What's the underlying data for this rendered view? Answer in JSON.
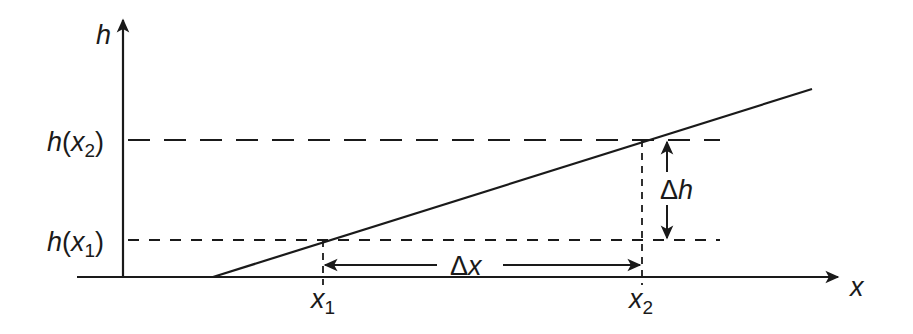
{
  "diagram": {
    "axes": {
      "y_label": "h",
      "x_label": "x"
    },
    "levels": {
      "h_x2": {
        "fn": "h",
        "arg": "x",
        "sub": "2"
      },
      "h_x1": {
        "fn": "h",
        "arg": "x",
        "sub": "1"
      }
    },
    "ticks": {
      "x1": {
        "base": "x",
        "sub": "1"
      },
      "x2": {
        "base": "x",
        "sub": "2"
      }
    },
    "deltas": {
      "dx": {
        "delta": "Δ",
        "var": "x"
      },
      "dh": {
        "delta": "Δ",
        "var": "h"
      }
    },
    "colors": {
      "ink": "#1a1a1a",
      "background": "#ffffff"
    }
  }
}
